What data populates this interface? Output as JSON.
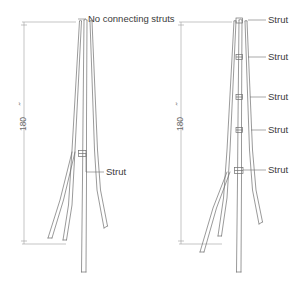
{
  "drawing": {
    "title": "Tripod easel frame comparison drawing",
    "background_color": "#ffffff",
    "line_color": "#6e6e6e",
    "dimension_color": "#a0a0a0",
    "text_color": "#3a3a3a"
  },
  "left_figure": {
    "name": "tripod-without-struts",
    "dimension": {
      "value": "180",
      "unit_mark": "˝",
      "orientation": "vertical"
    },
    "annotations": [
      {
        "id": "no-connecting-struts",
        "label": "No connecting struts"
      },
      {
        "id": "strut-lower",
        "label": "Strut"
      }
    ]
  },
  "right_figure": {
    "name": "tripod-with-struts",
    "dimension": {
      "value": "180",
      "unit_mark": "˝",
      "orientation": "vertical"
    },
    "annotations": [
      {
        "id": "strut-1",
        "label": "Strut"
      },
      {
        "id": "strut-2",
        "label": "Strut"
      },
      {
        "id": "strut-3",
        "label": "Strut"
      },
      {
        "id": "strut-4",
        "label": "Strut"
      },
      {
        "id": "strut-5",
        "label": "Strut"
      }
    ]
  }
}
